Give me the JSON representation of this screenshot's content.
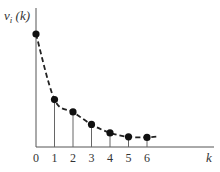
{
  "chart_data": {
    "type": "scatter",
    "subtype": "stem-plot-with-dashed-curve",
    "title": "",
    "xlabel": "k",
    "ylabel": "ν_i (k)",
    "ylabel_main": "ν",
    "ylabel_sub": "i",
    "ylabel_arg": " (k)",
    "x_tick_labels": [
      "0",
      "1",
      "2",
      "3",
      "4",
      "5",
      "6"
    ],
    "x": [
      0,
      1,
      2,
      3,
      4,
      5,
      6
    ],
    "values": [
      1.0,
      0.42,
      0.31,
      0.2,
      0.125,
      0.09,
      0.085
    ],
    "y_ticks": [],
    "grid": false,
    "legend": null,
    "curve_style": "dashed decaying curve through points",
    "note": "y values relative (no y-axis tick labels shown); k=0 normalized to 1.0"
  },
  "colors": {
    "ink": "#222222",
    "axis": "#555555",
    "stem": "#666666"
  }
}
